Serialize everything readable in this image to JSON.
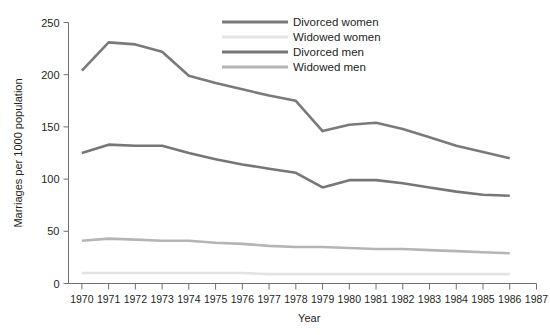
{
  "chart_data": {
    "type": "line",
    "title": "",
    "xlabel": "Year",
    "ylabel": "Marriages per 1000 population",
    "x": [
      1970,
      1971,
      1972,
      1973,
      1974,
      1975,
      1976,
      1977,
      1978,
      1979,
      1980,
      1981,
      1982,
      1983,
      1984,
      1985,
      1986
    ],
    "xlim": [
      1969.5,
      1987
    ],
    "ylim": [
      0,
      250
    ],
    "yticks": [
      0,
      50,
      100,
      150,
      200,
      250
    ],
    "xticks": [
      1970,
      1971,
      1972,
      1973,
      1974,
      1975,
      1976,
      1977,
      1978,
      1979,
      1980,
      1981,
      1982,
      1983,
      1984,
      1985,
      1986,
      1987
    ],
    "grid": false,
    "legend_position": "top-right",
    "series": [
      {
        "name": "Divorced women",
        "color": "#7a7a7a",
        "values": [
          204,
          231,
          229,
          222,
          199,
          192,
          186,
          180,
          175,
          146,
          152,
          154,
          148,
          140,
          132,
          126,
          120
        ]
      },
      {
        "name": "Widowed women",
        "color": "#e3e3e3",
        "values": [
          10,
          10,
          10,
          10,
          10,
          10,
          10,
          9,
          9,
          9,
          9,
          9,
          9,
          9,
          9,
          9,
          9
        ]
      },
      {
        "name": "Divorced men",
        "color": "#767676",
        "values": [
          125,
          133,
          132,
          132,
          125,
          119,
          114,
          110,
          106,
          92,
          99,
          99,
          96,
          92,
          88,
          85,
          84
        ]
      },
      {
        "name": "Widowed men",
        "color": "#b5b5b5",
        "values": [
          41,
          43,
          42,
          41,
          41,
          39,
          38,
          36,
          35,
          35,
          34,
          33,
          33,
          32,
          31,
          30,
          29
        ]
      }
    ]
  },
  "axis": {
    "y_tick_labels": [
      "0",
      "50",
      "100",
      "150",
      "200",
      "250"
    ],
    "x_tick_labels": [
      "1970",
      "1971",
      "1972",
      "1973",
      "1974",
      "1975",
      "1976",
      "1977",
      "1978",
      "1979",
      "1980",
      "1981",
      "1982",
      "1983",
      "1984",
      "1985",
      "1986",
      "1987"
    ],
    "x_title": "Year",
    "y_title": "Marriages per 1000 population"
  },
  "legend": {
    "items": [
      {
        "label": "Divorced women",
        "color": "#7a7a7a"
      },
      {
        "label": "Widowed women",
        "color": "#e3e3e3"
      },
      {
        "label": "Divorced men",
        "color": "#767676"
      },
      {
        "label": "Widowed men",
        "color": "#b5b5b5"
      }
    ]
  }
}
